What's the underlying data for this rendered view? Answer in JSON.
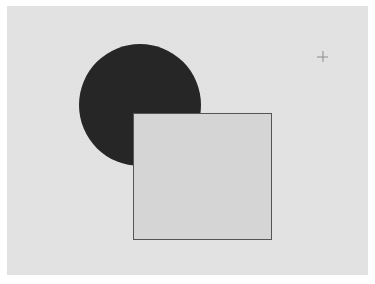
{
  "page": {
    "background_color": "#ffffff",
    "width": 375,
    "height": 284
  },
  "canvas": {
    "name": "shapes-canvas",
    "background_color": "#e3e3e3",
    "x": 7,
    "y": 6,
    "width": 361,
    "height": 269
  },
  "shapes": [
    {
      "id": "circle",
      "type": "circle",
      "label": "Dark filled circle",
      "fill_color": "#262626",
      "stroke_color": "none",
      "stroke_width": 0,
      "center_x": 140,
      "center_y": 105,
      "radius": 61,
      "left": 79,
      "top": 44,
      "width": 122,
      "height": 122,
      "z_index": 1
    },
    {
      "id": "square",
      "type": "rectangle",
      "label": "Light gray outlined square",
      "fill_color": "#d5d5d5",
      "stroke_color": "#555555",
      "stroke_width": 1,
      "left": 133,
      "top": 113,
      "width": 139,
      "height": 127,
      "z_index": 2
    }
  ],
  "pointer": {
    "id": "crosshair",
    "label": "Crosshair pointer",
    "icon": "crosshair-plus-icon",
    "color": "#8c8c8c",
    "x": 322,
    "y": 56,
    "size": 11
  }
}
